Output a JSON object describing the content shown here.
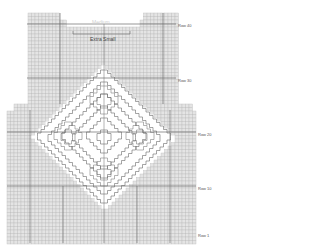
{
  "chart": {
    "cell_px": 3.5,
    "colors": {
      "background_cell": "#e4e4e4",
      "grid_line": "#bdbdbd",
      "major_line": "#6a6a6a",
      "motif_fill": "#ffffff",
      "motif_line": "#6a6a6a"
    }
  },
  "row_labels": [
    {
      "text": "Row 40",
      "x": 178,
      "y": 23
    },
    {
      "text": "Row 30",
      "x": 178,
      "y": 78
    },
    {
      "text": "Row 20",
      "x": 198,
      "y": 132
    },
    {
      "text": "Row 10",
      "x": 198,
      "y": 186
    },
    {
      "text": "Row 1",
      "x": 198,
      "y": 233
    }
  ],
  "size_labels": {
    "medium": "Medium",
    "extra_small": "Extra Small"
  }
}
